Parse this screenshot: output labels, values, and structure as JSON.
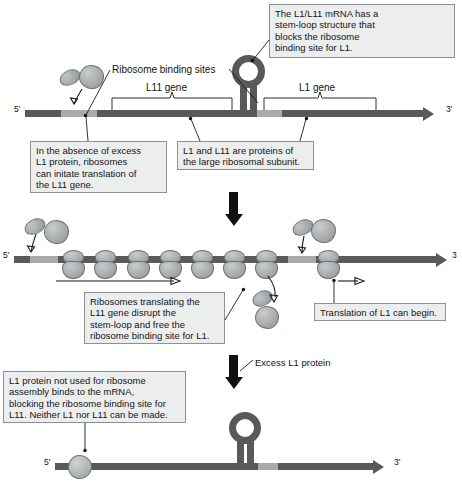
{
  "figure": {
    "strand_labels": {
      "five_prime": "5'",
      "three_prime": "3'",
      "three_prime_plain": "3"
    }
  },
  "panel1": {
    "callouts": {
      "stem_loop": "The L1/L11 mRNA has a\nstem-loop structure that\nblocks the ribosome\nbinding site for L1.",
      "no_excess_l1": "In the absence of excess\nL1 protein, ribosomes\ncan initate translation of\nthe L11 gene.",
      "proteins": "L1 and L11 are proteins of\nthe large ribosomal subunit."
    },
    "labels": {
      "binding_sites": "Ribosome binding sites",
      "l11_gene": "L11 gene",
      "l1_gene": "L1 gene"
    }
  },
  "panel2": {
    "callouts": {
      "ribosomes_disrupt": "Ribosomes translating the\nL11 gene disrupt the\nstem-loop and free the\nribosome binding site for L1.",
      "translation_begins": "Translation of L1 can begin."
    },
    "ribosome_count_l11": 7,
    "ribosome_count_l1": 1
  },
  "transition": {
    "excess_l1_label": "Excess L1 protein"
  },
  "panel3": {
    "callouts": {
      "l1_blocks": "L1 protein not used for ribosome\nassembly binds to the mRNA,\nblocking the ribosome binding site for\nL11. Neither L1 nor L11 can be made."
    }
  },
  "colors": {
    "strand_dark": "#58595b",
    "strand_light": "#a8aaac",
    "box_fill": "#eceeee",
    "box_border": "#8d9194",
    "ribosome": "#a9adae",
    "ink": "#1a1a1a"
  }
}
